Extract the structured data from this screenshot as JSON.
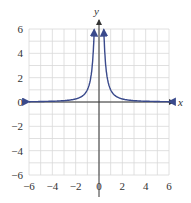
{
  "chart_data": {
    "type": "line",
    "title": "",
    "xlabel": "x",
    "ylabel": "y",
    "xlim": [
      -6,
      6
    ],
    "ylim": [
      -6,
      6
    ],
    "grid": true,
    "grid_step": 1,
    "x_ticks": [
      -6,
      -4,
      -2,
      0,
      2,
      4,
      6
    ],
    "y_ticks": [
      -6,
      -4,
      -2,
      0,
      2,
      4,
      6
    ],
    "x_tick_labels": [
      "−6",
      "−4",
      "−2",
      "0",
      "2",
      "4",
      "6"
    ],
    "y_tick_labels": [
      "6",
      "4",
      "2",
      "0",
      "−2",
      "−4",
      "−6"
    ],
    "series": [
      {
        "name": "y = 1/x² (left branch)",
        "x": [
          -6,
          -5,
          -4,
          -3,
          -2,
          -1.5,
          -1,
          -0.8,
          -0.6,
          -0.5,
          -0.41
        ],
        "y": [
          0.03,
          0.04,
          0.06,
          0.11,
          0.25,
          0.44,
          1.0,
          1.56,
          2.78,
          4.0,
          5.9
        ]
      },
      {
        "name": "y = 1/x² (right branch)",
        "x": [
          0.41,
          0.5,
          0.6,
          0.8,
          1,
          1.5,
          2,
          3,
          4,
          5,
          6
        ],
        "y": [
          5.9,
          4.0,
          2.78,
          1.56,
          1.0,
          0.44,
          0.25,
          0.11,
          0.06,
          0.04,
          0.03
        ]
      }
    ],
    "colors": {
      "curve": "#3a4a8c",
      "axis": "#333333",
      "grid": "#d8d8d8"
    }
  }
}
